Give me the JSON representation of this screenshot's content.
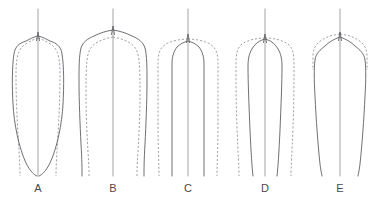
{
  "figure": {
    "width": 377,
    "height": 201,
    "background": "#ffffff",
    "solid_color": "#55555c",
    "dashed_color": "#8e8e96",
    "axis_color": "#9a9a9a",
    "label_color": "#4a4a4a",
    "label_baseline_y": 192,
    "panel_count": 5
  },
  "chart_data": {
    "type": "line",
    "title": "",
    "subtitle": "",
    "xlabel": "",
    "ylabel": "",
    "grid": false,
    "legend_position": "none",
    "legend": [
      {
        "name": "solid",
        "style": "solid",
        "color": "#55555c"
      },
      {
        "name": "dashed",
        "style": "dashed",
        "color": "#8e8e96"
      }
    ],
    "axis_ranges": {
      "x": [
        0,
        377
      ],
      "y": [
        0,
        201
      ]
    },
    "annotations": [
      "A",
      "B",
      "C",
      "D",
      "E"
    ],
    "panels": [
      {
        "label": "A",
        "center_x": 38,
        "label_x": 38,
        "axis_top_y": 9,
        "axis_bottom_y": 176,
        "apex_y": 36,
        "base_y": 176,
        "solid_max_half_width": 25,
        "dashed_max_half_width": 21,
        "solid_base_half_width": 3,
        "dashed_base_half_width": 18,
        "description": "broad shouldered solid outline tapering to a point at the base; dashed outline narrower above and flaring vertically at the base",
        "solid_path": "M 38 36 C 33 37 30 39 26 41 C 20 43 15 46 14 54 C 12 66 12 86 13 104 C 14 124 19 148 26 163 C 30 171 34 175 37 176 M 38 36 C 43 37 46 39 50 41 C 56 43 61 46 62 54 C 64 66 64 86 63 104 C 62 124 57 148 50 163 C 46 171 42 175 39 176",
        "dashed_path": "M 38 38 C 32 40 26 43 22 47 C 17 52 16 62 16 76 C 16 96 17 118 18 134 C 19 150 20 166 20 176 M 38 38 C 44 40 50 43 54 47 C 59 52 60 62 60 76 C 60 96 59 118 58 134 C 57 150 56 166 56 176"
      },
      {
        "label": "B",
        "center_x": 113,
        "label_x": 113,
        "axis_top_y": 9,
        "axis_bottom_y": 176,
        "apex_y": 30,
        "base_y": 176,
        "solid_max_half_width": 34,
        "dashed_max_half_width": 27,
        "solid_base_half_width": 30,
        "dashed_base_half_width": 24,
        "description": "widest solid outline with rounded shoulders; dashed outline nested just inside and roughly parallel",
        "solid_path": "M 113 30 C 106 31 100 33 94 36 C 87 39 83 42 81 48 C 79 56 79 68 79 82 C 79 100 80 124 81 144 C 82 160 82 170 82 176 M 113 30 C 120 31 126 33 132 36 C 139 39 143 42 145 48 C 147 56 147 68 147 82 C 147 100 146 124 145 144 C 144 160 144 170 144 176",
        "dashed_path": "M 113 37 C 107 38 101 40 96 43 C 90 47 88 52 87 60 C 86 70 86 82 86 96 C 86 114 87 134 88 152 C 89 166 89 172 89 176 M 113 37 C 119 38 125 40 130 43 C 136 47 138 52 139 60 C 140 70 140 82 140 96 C 140 114 139 134 138 152 C 137 166 137 172 137 176"
      },
      {
        "label": "C",
        "center_x": 188,
        "label_x": 188,
        "axis_top_y": 9,
        "axis_bottom_y": 176,
        "apex_y": 38,
        "base_y": 176,
        "solid_max_half_width": 17,
        "dashed_max_half_width": 29,
        "solid_base_half_width": 14,
        "dashed_base_half_width": 27,
        "description": "dashed outline forms the wide outer envelope; solid outline narrow with nearly parallel vertical sides",
        "solid_path": "M 188 41 C 184 42 180 44 177 47 C 174 51 172 56 172 64 C 172 78 172 100 172 124 C 172 148 172 166 172 176 M 188 41 C 192 42 196 44 199 47 C 202 51 204 56 204 64 C 204 78 204 100 204 124 C 204 148 204 166 204 176",
        "dashed_path": "M 188 39 C 180 39 172 41 166 44 C 160 48 158 53 158 62 C 158 76 158 98 158 122 C 158 146 159 166 159 176 M 188 39 C 196 39 204 41 210 44 C 216 48 218 53 218 62 C 218 76 218 98 218 122 C 218 146 217 166 217 176"
      },
      {
        "label": "D",
        "center_x": 265,
        "label_x": 265,
        "axis_top_y": 9,
        "axis_bottom_y": 176,
        "apex_y": 38,
        "base_y": 176,
        "solid_max_half_width": 18,
        "dashed_max_half_width": 29,
        "solid_base_half_width": 13,
        "dashed_base_half_width": 26,
        "description": "dashed outline forms the wide outer bell; solid outline narrower and converging slightly towards the base",
        "solid_path": "M 265 39 C 261 40 257 42 254 46 C 250 51 248 57 248 66 C 248 82 249 106 250 130 C 251 152 252 168 253 176 M 265 39 C 269 40 273 42 276 46 C 280 51 282 57 282 66 C 282 82 281 106 280 130 C 279 152 278 168 277 176",
        "dashed_path": "M 265 38 C 257 38 248 40 242 44 C 237 48 236 54 236 64 C 236 80 236 104 237 128 C 238 152 239 168 239 176 M 265 38 C 273 38 282 40 288 44 C 293 48 294 54 294 64 C 294 80 294 104 293 128 C 292 152 291 168 291 176"
      },
      {
        "label": "E",
        "center_x": 340,
        "label_x": 340,
        "axis_top_y": 9,
        "axis_bottom_y": 176,
        "apex_y": 36,
        "base_y": 176,
        "solid_max_half_width": 26,
        "dashed_max_half_width": 27,
        "solid_base_half_width": 20,
        "dashed_base_half_width": 26,
        "description": "dashed arc forms a rounded dome across the shoulders only; solid outline with square shoulders tapering slightly inward toward the base",
        "solid_path": "M 340 37 C 334 39 329 42 325 46 C 320 50 316 53 315 60 C 314 68 314 80 315 96 C 316 118 318 146 320 164 C 321 172 322 175 322 176 M 340 37 C 346 39 351 42 355 46 C 360 50 364 53 365 60 C 366 68 366 80 365 96 C 364 118 362 146 360 164 C 359 172 358 175 358 176",
        "dashed_path": "M 340 34 C 331 35 323 38 318 43 C 314 47 313 51 313 57 C 313 62 313 66 313 70 M 340 34 C 349 35 357 38 362 43 C 366 47 367 51 367 57 C 367 62 367 66 367 70"
      }
    ]
  }
}
